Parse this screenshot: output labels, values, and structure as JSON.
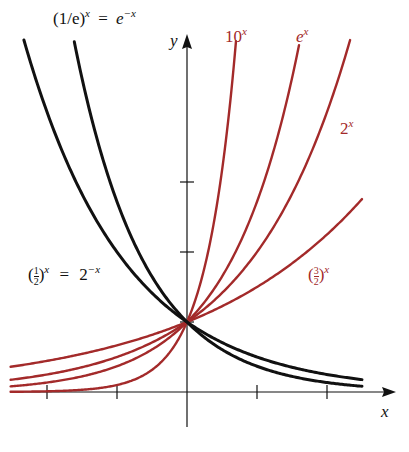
{
  "chart_data": {
    "type": "line",
    "title": "",
    "xlabel": "x",
    "ylabel": "y",
    "xlim": [
      -2.52,
      3.0
    ],
    "ylim": [
      -0.5,
      5.1
    ],
    "x_ticks": [
      -2,
      -1,
      1,
      2
    ],
    "y_ticks": [
      1,
      2,
      3
    ],
    "grid": false,
    "series": [
      {
        "name": "10^x",
        "base": 10,
        "color": "#a32a2a",
        "x_range": [
          -2.52,
          0.7
        ],
        "label": {
          "main": "10",
          "sup": "x"
        }
      },
      {
        "name": "e^x",
        "base": 2.718281828,
        "color": "#a32a2a",
        "x_range": [
          -2.52,
          1.6
        ],
        "label": {
          "main": "e",
          "sup": "x"
        }
      },
      {
        "name": "2^x",
        "base": 2,
        "color": "#a32a2a",
        "x_range": [
          -2.52,
          2.33
        ],
        "label": {
          "main": "2",
          "sup": "x"
        }
      },
      {
        "name": "(3/2)^x",
        "base": 1.5,
        "color": "#a32a2a",
        "x_range": [
          -2.52,
          2.5
        ],
        "label": {
          "num": "3",
          "den": "2",
          "sup": "x"
        }
      },
      {
        "name": "(1/e)^x = e^-x",
        "base": 0.3678794412,
        "color": "#111111",
        "x_range": [
          -1.61,
          2.5
        ],
        "label": {
          "lhs": "(1/e)",
          "lhs_sup": "x",
          "eq": "=",
          "rhs": "e",
          "rhs_sup": "−x"
        }
      },
      {
        "name": "(1/2)^x = 2^-x",
        "base": 0.5,
        "color": "#111111",
        "x_range": [
          -2.33,
          2.5
        ],
        "label": {
          "num": "1",
          "den": "2",
          "lhs_sup": "x",
          "eq": "=",
          "rhs": "2",
          "rhs_sup": "−x"
        }
      }
    ]
  }
}
